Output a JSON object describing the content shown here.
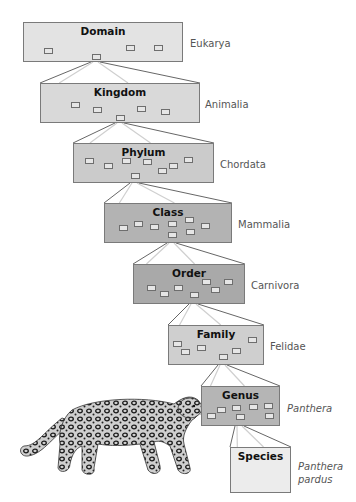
{
  "diagram": {
    "levels": [
      {
        "rank": "Domain",
        "taxon": "Eukarya",
        "italic": false,
        "fill": "#e3e3e3",
        "box": [
          23,
          22,
          160,
          40
        ],
        "label": [
          190,
          37
        ],
        "minis": [
          [
            20,
            25
          ],
          [
            68,
            31
          ],
          [
            102,
            22
          ],
          [
            130,
            22
          ]
        ]
      },
      {
        "rank": "Kingdom",
        "taxon": "Animalia",
        "italic": false,
        "fill": "#d9d9d9",
        "box": [
          40,
          83,
          160,
          40
        ],
        "label": [
          205,
          98
        ],
        "minis": [
          [
            30,
            18
          ],
          [
            52,
            23
          ],
          [
            96,
            22
          ],
          [
            120,
            25
          ],
          [
            75,
            31
          ]
        ]
      },
      {
        "rank": "Phylum",
        "taxon": "Chordata",
        "italic": false,
        "fill": "#cbcbcb",
        "box": [
          73,
          143,
          141,
          40
        ],
        "label": [
          220,
          158
        ],
        "minis": [
          [
            11,
            14
          ],
          [
            30,
            19
          ],
          [
            48,
            14
          ],
          [
            69,
            15
          ],
          [
            84,
            24
          ],
          [
            95,
            19
          ],
          [
            110,
            13
          ],
          [
            57,
            29
          ]
        ]
      },
      {
        "rank": "Class",
        "taxon": "Mammalia",
        "italic": false,
        "fill": "#b3b3b3",
        "box": [
          104,
          203,
          128,
          40
        ],
        "label": [
          238,
          218
        ],
        "minis": [
          [
            14,
            21
          ],
          [
            29,
            17
          ],
          [
            45,
            20
          ],
          [
            63,
            17
          ],
          [
            80,
            13
          ],
          [
            96,
            19
          ],
          [
            63,
            28
          ],
          [
            81,
            25
          ]
        ]
      },
      {
        "rank": "Order",
        "taxon": "Carnivora",
        "italic": false,
        "fill": "#a9a9a9",
        "box": [
          133,
          264,
          112,
          40
        ],
        "label": [
          251,
          279
        ],
        "minis": [
          [
            13,
            20
          ],
          [
            26,
            26
          ],
          [
            40,
            20
          ],
          [
            56,
            27
          ],
          [
            68,
            14
          ],
          [
            77,
            22
          ],
          [
            90,
            14
          ]
        ]
      },
      {
        "rank": "Family",
        "taxon": "Felidae",
        "italic": false,
        "fill": "#cfcfcf",
        "box": [
          168,
          325,
          96,
          40
        ],
        "label": [
          270,
          340
        ],
        "minis": [
          [
            4,
            15
          ],
          [
            12,
            23
          ],
          [
            28,
            19
          ],
          [
            50,
            28
          ],
          [
            63,
            22
          ],
          [
            79,
            11
          ]
        ]
      },
      {
        "rank": "Genus",
        "taxon": "Panthera",
        "italic": true,
        "fill": "#b5b5b5",
        "box": [
          201,
          386,
          79,
          40
        ],
        "label": [
          287,
          402
        ],
        "minis": [
          [
            5,
            26
          ],
          [
            15,
            20
          ],
          [
            30,
            18
          ],
          [
            47,
            17
          ],
          [
            62,
            16
          ],
          [
            34,
            27
          ],
          [
            63,
            26
          ]
        ]
      },
      {
        "rank": "Species",
        "taxon": "Panthera pardus",
        "taxon_lines": [
          "Panthera",
          "pardus"
        ],
        "italic": true,
        "fill": "#ececec",
        "box": [
          230,
          447,
          61,
          46
        ],
        "label": [
          298,
          460
        ],
        "minis": []
      }
    ],
    "illustration": {
      "subject": "leopard",
      "label": "leopard-illustration"
    }
  }
}
